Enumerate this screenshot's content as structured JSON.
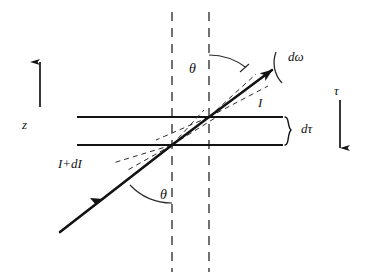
{
  "figure": {
    "kind": "radiative-transfer-slab-diagram",
    "colors": {
      "ink": "#131313",
      "dashed_guide": "#4a4a4a",
      "background": "#ffffff"
    }
  },
  "axes": {
    "vertical_z": {
      "label": "z",
      "direction": "up",
      "arrow_x": 40,
      "arrow_top_y": 55,
      "arrow_bottom_y": 107
    },
    "vertical_tau": {
      "label": "τ",
      "direction": "down",
      "arrow_x": 340,
      "arrow_top_y": 100,
      "arrow_bottom_y": 156
    }
  },
  "slab": {
    "top_boundary_y": 117,
    "bottom_boundary_y": 145,
    "x_start": 77,
    "x_end": 283,
    "thickness_label": "dτ",
    "brace_x": 287
  },
  "normals": {
    "left_dashed_x": 172,
    "right_dashed_x": 209,
    "y_top": 12,
    "y_bottom": 272
  },
  "ray": {
    "incoming_label": "I+dI",
    "outgoing_label": "I",
    "solid_angle_label": "dω",
    "angle_label_top": "θ",
    "angle_label_bottom": "θ",
    "start_x": 60,
    "start_y": 232,
    "end_x": 272,
    "end_y": 70,
    "lower_intersection_x": 172,
    "lower_intersection_y": 145,
    "upper_intersection_x": 209,
    "upper_intersection_y": 117,
    "midway_arrow_x": 98,
    "midway_arrow_y": 203
  },
  "angles": {
    "top": {
      "value_label": "θ",
      "vertex_x": 209,
      "vertex_y": 117,
      "radius": 62
    },
    "bottom": {
      "value_label": "θ",
      "vertex_x": 172,
      "vertex_y": 145,
      "radius": 58
    }
  }
}
